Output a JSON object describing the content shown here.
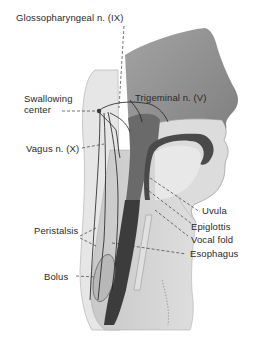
{
  "figure": {
    "type": "anatomical-illustration",
    "colors": {
      "background": "#ffffff",
      "head_fill": "#8f8f8f",
      "neck_fill": "#d4d4d4",
      "light_tissue": "#e4e4e4",
      "pharynx_dark": "#4a4a4a",
      "nerve_line": "#1e1e1e",
      "leader_line": "#3a3a3a",
      "label_text": "#2a2a2a"
    }
  },
  "labels": {
    "glossopharyngeal": "Glossopharyngeal n. (IX)",
    "swallowing_center_line1": "Swallowing",
    "swallowing_center_line2": "center",
    "trigeminal": "Trigeminal n. (V)",
    "vagus": "Vagus n. (X)",
    "uvula": "Uvula",
    "epiglottis": "Epiglottis",
    "vocal_fold": "Vocal fold",
    "peristalsis": "Peristalsis",
    "esophagus": "Esophagus",
    "bolus": "Bolus"
  }
}
